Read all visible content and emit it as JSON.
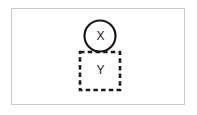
{
  "figure": {
    "title": "",
    "background_color": "#ffffff",
    "frame_color": "#c9c9c9",
    "stroke_color": "#1a1a1a"
  },
  "diagram": {
    "type": "node-diagram",
    "nodes": [
      {
        "id": "x",
        "shape": "circle",
        "label": "X",
        "line_style": "solid",
        "stroke_color": "#1a1a1a",
        "fill": "none",
        "center": {
          "x": 100,
          "y": 36
        },
        "radius": 16
      },
      {
        "id": "y",
        "shape": "rectangle",
        "label": "Y",
        "line_style": "dashed",
        "stroke_color": "#1a1a1a",
        "fill": "none",
        "bounds": {
          "x": 80,
          "y": 52,
          "width": 40,
          "height": 38
        }
      }
    ],
    "relations": [
      {
        "from": "x",
        "to": "y",
        "type": "overlap",
        "description": "circle X overlaps the top edge of dashed rectangle Y"
      }
    ]
  }
}
